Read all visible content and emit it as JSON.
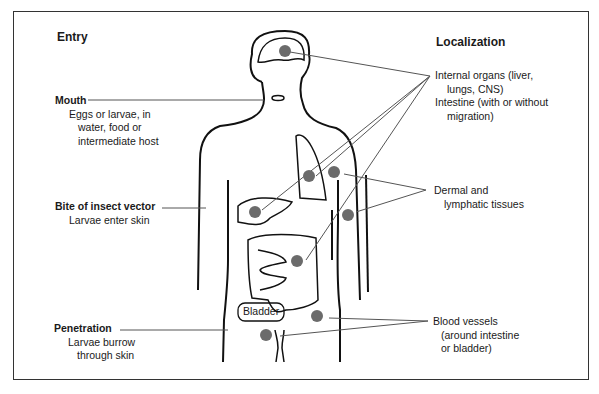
{
  "diagram": {
    "left_heading": "Entry",
    "right_heading": "Localization",
    "entry": [
      {
        "title": "Mouth",
        "lines": [
          "Eggs or larvae, in",
          "water, food or",
          "intermediate host"
        ]
      },
      {
        "title": "Bite of insect vector",
        "lines": [
          "Larvae enter skin"
        ]
      },
      {
        "title": "Penetration",
        "lines": [
          "Larvae burrow",
          "through skin"
        ]
      }
    ],
    "localization": [
      {
        "lines": [
          "Internal organs (liver,",
          "lungs, CNS)",
          "Intestine (with or without",
          "migration)"
        ]
      },
      {
        "lines": [
          "Dermal and",
          "lymphatic tissues"
        ]
      },
      {
        "lines": [
          "Blood vessels",
          "(around intestine",
          "or bladder)"
        ]
      }
    ],
    "organ_label": "Bladder",
    "colors": {
      "dot": "#6b6b6b",
      "line": "#555555",
      "outline": "#111111"
    }
  }
}
